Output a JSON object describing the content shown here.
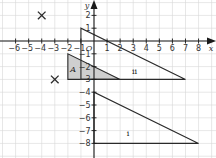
{
  "diagram": {
    "type": "coordinate-grid-transformations",
    "axes": {
      "x_label": "x",
      "y_label": "y",
      "origin_label": "O",
      "x_range": [
        -7,
        8.5
      ],
      "y_range": [
        -9,
        3
      ],
      "x_ticks": [
        -6,
        -5,
        -4,
        -3,
        -2,
        -1,
        1,
        2,
        3,
        4,
        5,
        6,
        7,
        8
      ],
      "y_ticks": [
        2,
        1,
        -1,
        -2,
        -3,
        -4,
        -5,
        -6,
        -7,
        -8
      ],
      "grid": true
    },
    "shapes": [
      {
        "name": "triangle-A",
        "label": "A",
        "label_italic": true,
        "shaded": true,
        "fill": "#cfcfcf",
        "vertices": [
          [
            -2,
            -1
          ],
          [
            -2,
            -3
          ],
          [
            2,
            -3
          ]
        ],
        "label_pos": [
          -1.6,
          -2.4
        ]
      },
      {
        "name": "triangle-ii",
        "label": "ii",
        "label_italic": false,
        "shaded": false,
        "vertices": [
          [
            -1,
            1
          ],
          [
            -1,
            -3
          ],
          [
            7,
            -3
          ]
        ],
        "label_pos": [
          3.1,
          -2.6
        ]
      },
      {
        "name": "triangle-i",
        "label": "i",
        "label_italic": false,
        "shaded": false,
        "vertices": [
          [
            0,
            -4
          ],
          [
            0,
            -8
          ],
          [
            8,
            -8
          ]
        ],
        "label_pos": [
          2.6,
          -7.4
        ]
      }
    ],
    "crosses": [
      {
        "name": "cross-upper",
        "pos": [
          -4,
          2
        ]
      },
      {
        "name": "cross-lower",
        "pos": [
          -3,
          -3
        ]
      }
    ],
    "colors": {
      "grid": "#d6d6d6",
      "axis": "#1a1a1a",
      "outline": "#2a2a2a",
      "shade": "#cfcfcf"
    }
  }
}
